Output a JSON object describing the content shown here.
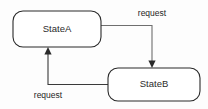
{
  "diagram": {
    "type": "state-machine",
    "title": "",
    "background_color": "#fdfdfd",
    "states": [
      {
        "id": "state-a",
        "label": "StateA",
        "x": 13,
        "y": 11,
        "width": 88,
        "height": 36,
        "corner_radius": 10,
        "fill": "#ffffff",
        "stroke": "#2a2a2a"
      },
      {
        "id": "state-b",
        "label": "StateB",
        "x": 108,
        "y": 68,
        "width": 92,
        "height": 33,
        "corner_radius": 10,
        "fill": "#ffffff",
        "stroke": "#2a2a2a"
      }
    ],
    "transitions": [
      {
        "id": "transition-a-to-b",
        "label": "request",
        "from": "state-a",
        "to": "state-b",
        "label_x": 152,
        "label_y": 14,
        "stroke": "#6f6f6f"
      },
      {
        "id": "transition-b-to-a",
        "label": "request",
        "from": "state-b",
        "to": "state-a",
        "label_x": 48,
        "label_y": 96,
        "stroke": "#3a3a3a"
      }
    ]
  }
}
